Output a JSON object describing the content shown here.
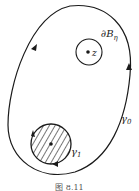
{
  "figure": {
    "caption": "图 8.11",
    "labels": {
      "small_circle": "∂B",
      "small_circle_sub": "η",
      "point": "z",
      "outer_curve": "γ",
      "outer_curve_sub": "0",
      "hatched_circle": "γ",
      "hatched_circle_sub": "1"
    },
    "colors": {
      "stroke": "#1a1a1a",
      "background": "#ffffff"
    }
  }
}
